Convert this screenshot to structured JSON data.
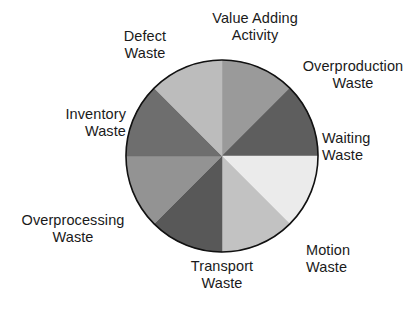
{
  "figure": {
    "title": "",
    "background": "#ffffff",
    "text_color": "#1a1a1a",
    "outline_color": "#111111"
  },
  "geometry": {
    "center_x": 222,
    "center_y": 156,
    "radius": 96
  },
  "labels": {
    "value_adding": "Value Adding\nActivity",
    "overproduction": "Overproduction\nWaste",
    "waiting": "Waiting\nWaste",
    "motion": "Motion\nWaste",
    "transport": "Transport\nWaste",
    "overprocessing": "Overprocessing\nWaste",
    "inventory": "Inventory\nWaste",
    "defect": "Defect\nWaste"
  },
  "chart_data": {
    "type": "pie",
    "title": "",
    "subtitle": "",
    "xlabel": "",
    "ylabel": "",
    "legend_position": "outside-labels",
    "grid": false,
    "start_angle_deg": 0,
    "direction": "clockwise",
    "total": 100,
    "categories": [
      "Value Adding Activity",
      "Overproduction Waste",
      "Waiting Waste",
      "Motion Waste",
      "Transport Waste",
      "Overprocessing Waste",
      "Inventory Waste",
      "Defect Waste"
    ],
    "values": [
      12.5,
      12.5,
      12.5,
      12.5,
      12.5,
      12.5,
      12.5,
      12.5
    ],
    "colors": [
      "#9a9a9a",
      "#5e5e5e",
      "#ebebeb",
      "#c2c2c2",
      "#585858",
      "#939393",
      "#6e6e6e",
      "#bcbcbc"
    ],
    "slices": [
      {
        "label": "Value Adding Activity",
        "value": 12.5,
        "color": "#9a9a9a",
        "start_deg": 0,
        "end_deg": 45
      },
      {
        "label": "Overproduction Waste",
        "value": 12.5,
        "color": "#5e5e5e",
        "start_deg": 45,
        "end_deg": 90
      },
      {
        "label": "Waiting Waste",
        "value": 12.5,
        "color": "#ebebeb",
        "start_deg": 90,
        "end_deg": 135
      },
      {
        "label": "Motion Waste",
        "value": 12.5,
        "color": "#c2c2c2",
        "start_deg": 135,
        "end_deg": 180
      },
      {
        "label": "Transport Waste",
        "value": 12.5,
        "color": "#585858",
        "start_deg": 180,
        "end_deg": 225
      },
      {
        "label": "Overprocessing Waste",
        "value": 12.5,
        "color": "#939393",
        "start_deg": 225,
        "end_deg": 270
      },
      {
        "label": "Inventory Waste",
        "value": 12.5,
        "color": "#6e6e6e",
        "start_deg": 270,
        "end_deg": 315
      },
      {
        "label": "Defect Waste",
        "value": 12.5,
        "color": "#bcbcbc",
        "start_deg": 315,
        "end_deg": 360
      }
    ]
  }
}
